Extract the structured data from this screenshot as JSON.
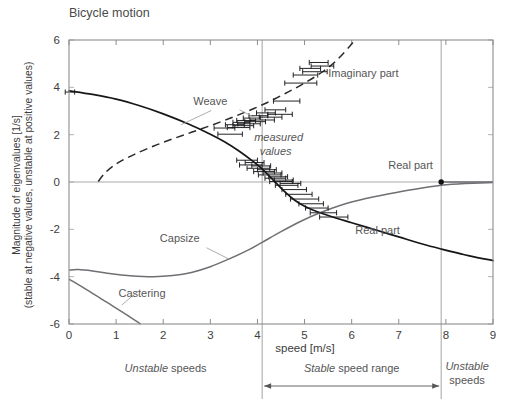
{
  "chart_data": {
    "type": "line",
    "title": "Bicycle motion",
    "xlabel": "speed   [m/s]",
    "ylabel_line1": "Magnitude of eigenvalues    [1/s]",
    "ylabel_line2": "(stable at negative values, unstable at positive values)",
    "xlim": [
      0,
      9
    ],
    "ylim": [
      -6,
      6
    ],
    "xticks": [
      0,
      1,
      2,
      3,
      4,
      5,
      6,
      7,
      8,
      9
    ],
    "xtick_labels": [
      "0",
      "1",
      "2",
      "3",
      "4",
      "5",
      "6",
      "7",
      "8",
      "9"
    ],
    "yticks": [
      -6,
      -4,
      -2,
      0,
      2,
      4,
      6
    ],
    "ytick_labels": [
      "-6",
      "-4",
      "-2",
      "0",
      "2",
      "4",
      "6"
    ],
    "grid": false,
    "legend_position": "inline-annotations",
    "axis_units": {
      "x": "m/s",
      "y": "1/s"
    },
    "annotations": [
      {
        "name": "weave-label",
        "text": "Weave",
        "x": 3.0,
        "y": 3.25
      },
      {
        "name": "imaginary-part-label",
        "text": "Imaginary part",
        "x": 6.25,
        "y": 4.45
      },
      {
        "name": "measured-values-label",
        "text": "measured",
        "text2": "values",
        "x": 4.45,
        "y": 1.75,
        "style": "italic"
      },
      {
        "name": "real-part-label-right",
        "text": "Real part",
        "x": 7.25,
        "y": 0.55
      },
      {
        "name": "real-part-label-lower",
        "text": "Real part",
        "x": 6.55,
        "y": -2.2
      },
      {
        "name": "capsize-label",
        "text": "Capsize",
        "x": 2.35,
        "y": -2.55
      },
      {
        "name": "castering-label",
        "text": "Castering",
        "x": 1.55,
        "y": -4.85
      }
    ],
    "region_markers": [
      {
        "name": "unstable-speeds-left",
        "text_italic": "Unstable",
        "text_plain": " speeds",
        "x_range": [
          0,
          4.1
        ]
      },
      {
        "name": "stable-speed-range",
        "text_italic": "Stable",
        "text_plain": " speed range",
        "x_range": [
          4.1,
          7.9
        ]
      },
      {
        "name": "unstable-speeds-right",
        "text_italic": "Unstable",
        "text_plain": "speeds",
        "x_range": [
          7.9,
          9
        ]
      }
    ],
    "vertical_dividers": [
      4.1,
      7.9
    ],
    "zero_crossing_dot": {
      "x": 7.9,
      "y": 0
    },
    "series": [
      {
        "name": "Weave real part",
        "style": "solid-black",
        "description": "Real part of weave eigenvalue: starts ~3.85 at v=0, decreases monotonically, crosses zero at ~4.3 m/s, continues to ~-3.3 at v=9",
        "points": [
          [
            0.0,
            3.85
          ],
          [
            0.5,
            3.7
          ],
          [
            1.0,
            3.5
          ],
          [
            1.5,
            3.22
          ],
          [
            2.0,
            2.88
          ],
          [
            2.5,
            2.48
          ],
          [
            3.0,
            2.02
          ],
          [
            3.3,
            1.7
          ],
          [
            3.6,
            1.32
          ],
          [
            3.9,
            0.88
          ],
          [
            4.1,
            0.55
          ],
          [
            4.3,
            0.15
          ],
          [
            4.4,
            -0.05
          ],
          [
            4.6,
            -0.45
          ],
          [
            4.8,
            -0.78
          ],
          [
            5.0,
            -1.02
          ],
          [
            5.3,
            -1.28
          ],
          [
            5.6,
            -1.48
          ],
          [
            6.0,
            -1.72
          ],
          [
            6.5,
            -2.02
          ],
          [
            7.0,
            -2.32
          ],
          [
            7.5,
            -2.62
          ],
          [
            7.9,
            -2.83
          ],
          [
            8.5,
            -3.12
          ],
          [
            9.0,
            -3.32
          ]
        ]
      },
      {
        "name": "Weave imaginary part",
        "style": "dashed-black",
        "description": "Imaginary part of weave eigenvalue: zero below ~0.65 m/s, rises steeply then near-linearly to ~5.9 at v=6",
        "points": [
          [
            0.62,
            0.02
          ],
          [
            0.75,
            0.35
          ],
          [
            0.9,
            0.62
          ],
          [
            1.1,
            0.88
          ],
          [
            1.4,
            1.18
          ],
          [
            1.8,
            1.52
          ],
          [
            2.2,
            1.82
          ],
          [
            2.6,
            2.1
          ],
          [
            3.0,
            2.38
          ],
          [
            3.4,
            2.68
          ],
          [
            3.8,
            3.0
          ],
          [
            4.2,
            3.35
          ],
          [
            4.6,
            3.75
          ],
          [
            5.0,
            4.18
          ],
          [
            5.4,
            4.68
          ],
          [
            5.7,
            5.18
          ],
          [
            5.95,
            5.72
          ],
          [
            6.05,
            5.95
          ]
        ]
      },
      {
        "name": "Capsize",
        "style": "solid-gray",
        "description": "Capsize mode eigenvalue: starts ~-3.72 at v=0, dips to ~-4.0 near 1.8 m/s, then rises towards zero, crossing zero at ~7.9 m/s and staying near zero",
        "points": [
          [
            0.0,
            -3.72
          ],
          [
            0.2,
            -3.7
          ],
          [
            0.5,
            -3.76
          ],
          [
            0.9,
            -3.88
          ],
          [
            1.3,
            -3.96
          ],
          [
            1.8,
            -4.0
          ],
          [
            2.2,
            -3.95
          ],
          [
            2.6,
            -3.82
          ],
          [
            3.0,
            -3.58
          ],
          [
            3.4,
            -3.25
          ],
          [
            3.8,
            -2.88
          ],
          [
            4.1,
            -2.55
          ],
          [
            4.5,
            -2.1
          ],
          [
            4.9,
            -1.68
          ],
          [
            5.3,
            -1.32
          ],
          [
            5.8,
            -0.96
          ],
          [
            6.3,
            -0.7
          ],
          [
            6.8,
            -0.5
          ],
          [
            7.3,
            -0.32
          ],
          [
            7.9,
            -0.14
          ],
          [
            8.4,
            -0.06
          ],
          [
            9.0,
            -0.02
          ]
        ]
      },
      {
        "name": "Castering",
        "style": "solid-gray",
        "description": "Castering mode eigenvalue: nearly straight descending line from ~-4.10 at v=0 to below -6 at ~1.52 m/s",
        "points": [
          [
            0.0,
            -4.1
          ],
          [
            0.4,
            -4.58
          ],
          [
            0.8,
            -5.08
          ],
          [
            1.2,
            -5.58
          ],
          [
            1.52,
            -6.0
          ]
        ]
      },
      {
        "name": "Real part zero segment",
        "style": "solid-gray-flat",
        "description": "Flat near-zero real-part branch to the right",
        "points": [
          [
            7.9,
            0.0
          ],
          [
            9.0,
            0.0
          ]
        ]
      }
    ],
    "measured_values_imaginary": [
      {
        "x": 3.3,
        "y": 2.28,
        "xerr": 0.22
      },
      {
        "x": 3.42,
        "y": 2.02,
        "xerr": 0.26
      },
      {
        "x": 3.52,
        "y": 2.42,
        "xerr": 0.2
      },
      {
        "x": 3.6,
        "y": 2.3,
        "xerr": 0.24
      },
      {
        "x": 3.66,
        "y": 2.52,
        "xerr": 0.18
      },
      {
        "x": 3.7,
        "y": 2.38,
        "xerr": 0.22
      },
      {
        "x": 3.76,
        "y": 2.6,
        "xerr": 0.2
      },
      {
        "x": 3.82,
        "y": 2.46,
        "xerr": 0.24
      },
      {
        "x": 3.88,
        "y": 2.7,
        "xerr": 0.18
      },
      {
        "x": 3.95,
        "y": 2.55,
        "xerr": 0.22
      },
      {
        "x": 4.02,
        "y": 2.8,
        "xerr": 0.2
      },
      {
        "x": 4.1,
        "y": 2.62,
        "xerr": 0.26
      },
      {
        "x": 4.18,
        "y": 2.92,
        "xerr": 0.2
      },
      {
        "x": 4.28,
        "y": 2.74,
        "xerr": 0.24
      },
      {
        "x": 4.38,
        "y": 3.05,
        "xerr": 0.22
      },
      {
        "x": 4.48,
        "y": 2.86,
        "xerr": 0.26
      },
      {
        "x": 4.62,
        "y": 3.42,
        "xerr": 0.28
      },
      {
        "x": 4.92,
        "y": 4.18,
        "xerr": 0.34
      },
      {
        "x": 5.02,
        "y": 4.52,
        "xerr": 0.26
      },
      {
        "x": 5.12,
        "y": 4.8,
        "xerr": 0.22
      },
      {
        "x": 5.22,
        "y": 4.66,
        "xerr": 0.26
      },
      {
        "x": 5.3,
        "y": 5.05,
        "xerr": 0.2
      },
      {
        "x": 5.38,
        "y": 4.9,
        "xerr": 0.24
      }
    ],
    "measured_values_real": [
      {
        "x": 0.02,
        "y": 3.8,
        "xerr": 0.1
      },
      {
        "x": 3.78,
        "y": 0.92,
        "xerr": 0.22
      },
      {
        "x": 3.86,
        "y": 0.72,
        "xerr": 0.24
      },
      {
        "x": 3.94,
        "y": 0.82,
        "xerr": 0.2
      },
      {
        "x": 4.02,
        "y": 0.58,
        "xerr": 0.24
      },
      {
        "x": 4.08,
        "y": 0.68,
        "xerr": 0.2
      },
      {
        "x": 4.14,
        "y": 0.44,
        "xerr": 0.22
      },
      {
        "x": 4.2,
        "y": 0.52,
        "xerr": 0.2
      },
      {
        "x": 4.26,
        "y": 0.3,
        "xerr": 0.24
      },
      {
        "x": 4.32,
        "y": 0.38,
        "xerr": 0.2
      },
      {
        "x": 4.38,
        "y": 0.16,
        "xerr": 0.22
      },
      {
        "x": 4.44,
        "y": 0.22,
        "xerr": 0.2
      },
      {
        "x": 4.5,
        "y": 0.02,
        "xerr": 0.24
      },
      {
        "x": 4.56,
        "y": 0.08,
        "xerr": 0.2
      },
      {
        "x": 4.62,
        "y": -0.14,
        "xerr": 0.24
      },
      {
        "x": 4.7,
        "y": -0.06,
        "xerr": 0.22
      },
      {
        "x": 4.78,
        "y": -0.32,
        "xerr": 0.26
      },
      {
        "x": 4.88,
        "y": -0.52,
        "xerr": 0.28
      },
      {
        "x": 5.0,
        "y": -0.72,
        "xerr": 0.3
      },
      {
        "x": 5.14,
        "y": -0.92,
        "xerr": 0.26
      },
      {
        "x": 5.26,
        "y": -1.1,
        "xerr": 0.24
      },
      {
        "x": 5.4,
        "y": -1.3,
        "xerr": 0.28
      },
      {
        "x": 5.62,
        "y": -1.48,
        "xerr": 0.3
      }
    ]
  },
  "colors": {
    "dark_curve": "#17171a",
    "gray_curve": "#6f6f74",
    "frame": "#8d8d8d",
    "text": "#3d3d3d",
    "label_text": "#565656",
    "leader": "#9d9d9d",
    "background": "#ffffff"
  }
}
